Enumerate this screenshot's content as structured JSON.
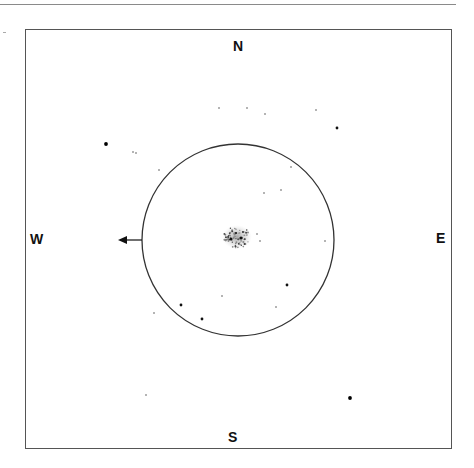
{
  "diagram": {
    "type": "astronomical finder sketch",
    "directions": {
      "north": "N",
      "south": "S",
      "east": "E",
      "west": "W"
    },
    "eyepiece_field": "circle",
    "motion_arrow": "west",
    "object": "nebulous cluster at field center",
    "colors": {
      "ink": "#111111",
      "frame": "#555555",
      "nebula": "#9a9a9a"
    }
  },
  "stars": [
    {
      "x": 106,
      "y": 144,
      "mag": "bright"
    },
    {
      "x": 133,
      "y": 152,
      "mag": "faint"
    },
    {
      "x": 136,
      "y": 153,
      "mag": "faint"
    },
    {
      "x": 219,
      "y": 108,
      "mag": "faint"
    },
    {
      "x": 247,
      "y": 108,
      "mag": "faint"
    },
    {
      "x": 265,
      "y": 114,
      "mag": "faint"
    },
    {
      "x": 316,
      "y": 110,
      "mag": "faint"
    },
    {
      "x": 337,
      "y": 128,
      "mag": "medium"
    },
    {
      "x": 159,
      "y": 170,
      "mag": "faint"
    },
    {
      "x": 291,
      "y": 167,
      "mag": "faint"
    },
    {
      "x": 281,
      "y": 190,
      "mag": "faint"
    },
    {
      "x": 264,
      "y": 193,
      "mag": "faint"
    },
    {
      "x": 325,
      "y": 241,
      "mag": "faint"
    },
    {
      "x": 257,
      "y": 234,
      "mag": "faint"
    },
    {
      "x": 260,
      "y": 241,
      "mag": "faint"
    },
    {
      "x": 287,
      "y": 285,
      "mag": "medium"
    },
    {
      "x": 222,
      "y": 296,
      "mag": "faint"
    },
    {
      "x": 181,
      "y": 305,
      "mag": "medium"
    },
    {
      "x": 276,
      "y": 307,
      "mag": "faint"
    },
    {
      "x": 154,
      "y": 313,
      "mag": "faint"
    },
    {
      "x": 202,
      "y": 319,
      "mag": "medium"
    },
    {
      "x": 350,
      "y": 398,
      "mag": "bright"
    },
    {
      "x": 146,
      "y": 395,
      "mag": "faint"
    }
  ]
}
